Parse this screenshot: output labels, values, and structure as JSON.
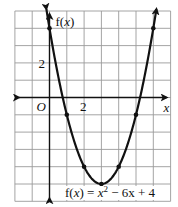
{
  "chart_data": {
    "type": "line",
    "title": "",
    "function": "f(x) = x^2 - 6x + 4",
    "equation_label": {
      "lhs": "f(",
      "var": "x",
      "rhs_open": ") = ",
      "x_term": "x",
      "exp": "2",
      "rest": " − 6x + 4"
    },
    "xlabel": "x",
    "ylabel": "f(x)",
    "origin_label": "O",
    "x_tick_labels": [
      {
        "value": 2,
        "label": "2"
      }
    ],
    "y_tick_labels": [
      {
        "value": 2,
        "label": "2"
      }
    ],
    "xlim": [
      -2,
      7
    ],
    "ylim": [
      -6,
      5
    ],
    "grid": true,
    "grid_step": 1,
    "series": [
      {
        "name": "f(x) = x^2 - 6x + 4",
        "marked_points": [
          {
            "x": 0,
            "y": 4
          },
          {
            "x": 1,
            "y": -1
          },
          {
            "x": 2,
            "y": -4
          },
          {
            "x": 3,
            "y": -5
          },
          {
            "x": 4,
            "y": -4
          },
          {
            "x": 5,
            "y": -1
          },
          {
            "x": 6,
            "y": 4
          }
        ],
        "vertex": {
          "x": 3,
          "y": -5
        },
        "arrow_ends": true
      }
    ],
    "colors": {
      "curve": "#111111",
      "grid": "#9a9a9a",
      "background": "#ffffff"
    }
  }
}
